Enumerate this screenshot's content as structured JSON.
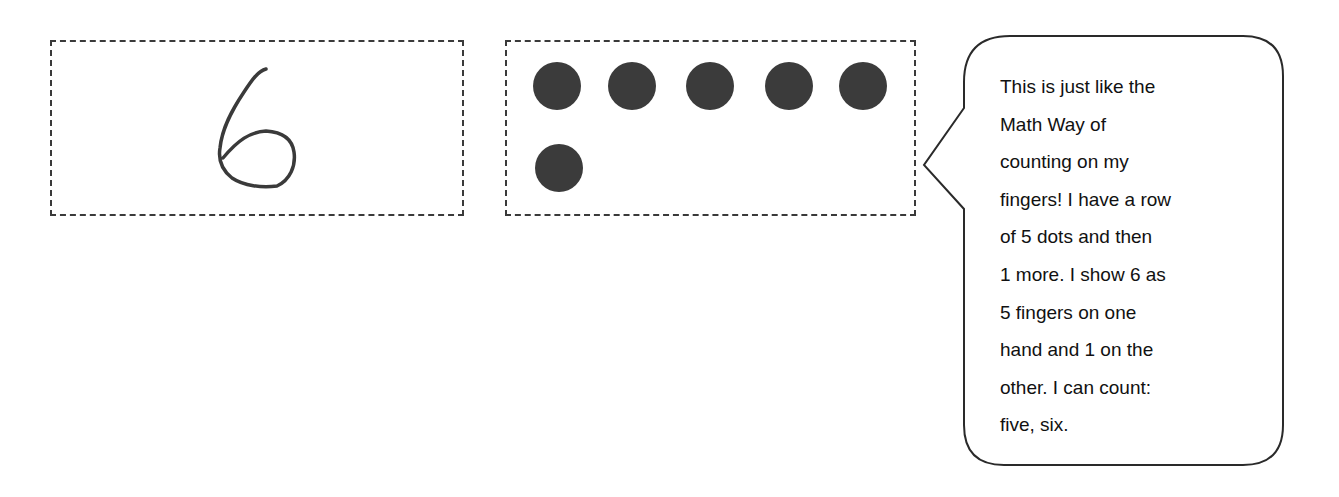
{
  "numeral_card": {
    "numeral": "6",
    "style": "handwritten"
  },
  "dot_card": {
    "dot_count": 6,
    "rows": [
      5,
      1
    ],
    "dot_color": "#3b3b3b"
  },
  "speech_bubble": {
    "lines": [
      "This is just like the",
      "Math Way of",
      "counting on my",
      "fingers!  I have a row",
      "of 5 dots and then",
      "1 more.  I show 6 as",
      "5 fingers on one",
      "hand and 1 on the",
      "other.  I can count:",
      "five, six."
    ]
  }
}
